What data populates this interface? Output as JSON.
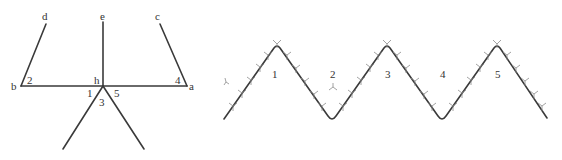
{
  "left_diagram": {
    "labels": {
      "d": "d",
      "e": "e",
      "c": "c",
      "b": "b",
      "h": "h",
      "a": "a",
      "angle1": "1",
      "angle2": "2",
      "angle3": "3",
      "angle4": "4",
      "angle5": "5"
    }
  },
  "right_diagram": {
    "labels": {
      "region1": "1",
      "region2": "2",
      "region3": "3",
      "region4": "4",
      "region5": "5"
    }
  },
  "colors": {
    "line": "#3a3a3a",
    "tick": "#8a8a8a",
    "text": "#333333"
  }
}
